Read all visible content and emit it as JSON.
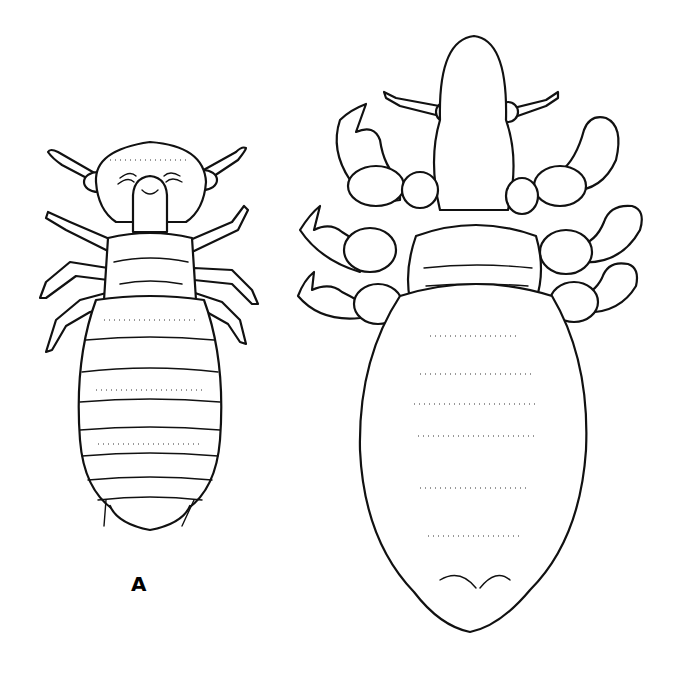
{
  "figure": {
    "panel_label": "A",
    "illustrations": [
      {
        "name": "louse-nymph",
        "label": "A"
      },
      {
        "name": "crab-louse-adult",
        "label": ""
      }
    ],
    "colors": {
      "ink": "#111111",
      "background": "#ffffff"
    }
  }
}
